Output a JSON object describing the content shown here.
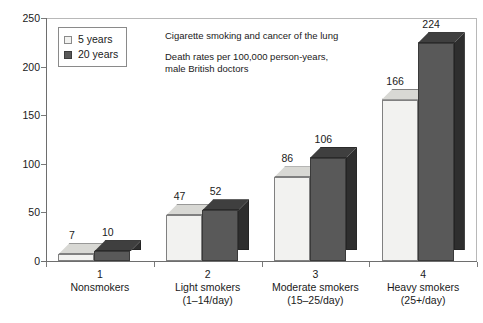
{
  "chart_data": {
    "type": "bar",
    "title": "",
    "annotations": [
      "Cigarette smoking and cancer of the lung",
      "Death rates per 100,000 person-years,",
      "male British doctors"
    ],
    "categories": [
      "Nonsmokers",
      "Light smokers",
      "Moderate smokers",
      "Heavy smokers"
    ],
    "category_numbers": [
      "1",
      "2",
      "3",
      "4"
    ],
    "category_sublabels": [
      "",
      "(1–14/day)",
      "(15–25/day)",
      "(25+/day)"
    ],
    "series": [
      {
        "name": "5 years",
        "values": [
          7,
          47,
          86,
          166
        ],
        "color": "#f2f2f0"
      },
      {
        "name": "20 years",
        "values": [
          10,
          52,
          106,
          224
        ],
        "color": "#595959"
      }
    ],
    "xlabel": "",
    "ylabel": "",
    "ylim": [
      0,
      250
    ],
    "yticks": [
      0,
      50,
      100,
      150,
      200,
      250
    ],
    "ytick_labels": [
      "0",
      "50",
      "100",
      "150",
      "200",
      "250"
    ],
    "grid": false,
    "legend_position": "upper-left",
    "three_d": true
  },
  "legend": {
    "items": [
      {
        "label": "5 years",
        "swatch": "light-swatch-icon"
      },
      {
        "label": "20 years",
        "swatch": "dark-swatch-icon"
      }
    ]
  },
  "annotations": {
    "title_line": "Cigarette smoking and cancer of the lung",
    "subtitle_line1": "Death rates per 100,000 person-years,",
    "subtitle_line2": "male British doctors"
  }
}
